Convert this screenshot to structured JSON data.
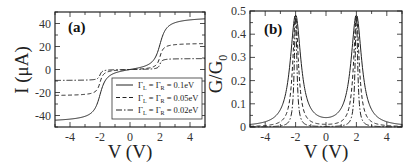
{
  "chart_data": [
    {
      "type": "line",
      "panel_label": "(a)",
      "title": "",
      "xlabel": "V (V)",
      "ylabel": "I (μA)",
      "xlim": [
        -5,
        5
      ],
      "ylim": [
        -50,
        50
      ],
      "xticks": [
        -4,
        -2,
        0,
        2,
        4
      ],
      "yticks": [
        -40,
        -20,
        0,
        20,
        40
      ],
      "grid": false,
      "legend_position": "lower right",
      "series": [
        {
          "name": "ΓL = ΓR = 0.1eV",
          "style": "solid",
          "amplitude": 46,
          "width": 0.1
        },
        {
          "name": "ΓL = ΓR = 0.05eV",
          "style": "dashed",
          "amplitude": 23,
          "width": 0.05
        },
        {
          "name": "ΓL = ΓR = 0.02eV",
          "style": "dashdot",
          "amplitude": 9.5,
          "width": 0.02
        }
      ],
      "legend": [
        {
          "main": "Γ",
          "sub1": "L",
          "mid": " = Γ",
          "sub2": "R",
          "value": " = 0.1eV"
        },
        {
          "main": "Γ",
          "sub1": "L",
          "mid": " = Γ",
          "sub2": "R",
          "value": " = 0.05eV"
        },
        {
          "main": "Γ",
          "sub1": "L",
          "mid": " = Γ",
          "sub2": "R",
          "value": " = 0.02eV"
        }
      ]
    },
    {
      "type": "line",
      "panel_label": "(b)",
      "title": "",
      "xlabel": "V (V)",
      "ylabel": "G/G0",
      "xlim": [
        -5,
        5
      ],
      "ylim": [
        0,
        0.5
      ],
      "xticks": [
        -4,
        -2,
        0,
        2,
        4
      ],
      "yticks": [
        0,
        0.1,
        0.2,
        0.3,
        0.4,
        0.5
      ],
      "grid": false,
      "peaks_at": [
        -2,
        2
      ],
      "peak_value": 0.48,
      "series": [
        {
          "name": "ΓL = ΓR = 0.1eV",
          "style": "solid",
          "peak": 0.48,
          "min_at_0": 0.035
        },
        {
          "name": "ΓL = ΓR = 0.05eV",
          "style": "dashed",
          "peak": 0.48,
          "min_at_0": 0.01
        },
        {
          "name": "ΓL = ΓR = 0.02eV",
          "style": "dashdot",
          "peak": 0.48,
          "min_at_0": 0.002
        }
      ]
    }
  ],
  "labels": {
    "a_panel": "(a)",
    "b_panel": "(b)",
    "a_xlabel": "V (V)",
    "a_ylabel": "I (μA)",
    "b_xlabel": "V (V)",
    "b_ylabel_main": "G/G",
    "b_ylabel_sub": "0"
  }
}
